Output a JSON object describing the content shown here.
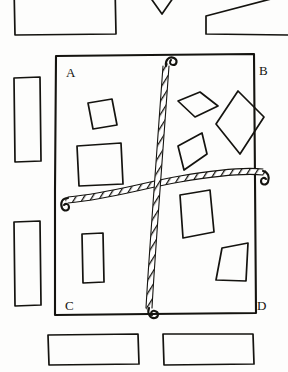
{
  "figure": {
    "kind": "hand-drawn-line-diagram",
    "medium": "ink-pen-sketch",
    "background_color": "#fdfdfc",
    "ink_color": "#14130f",
    "width": 288,
    "height": 372
  },
  "frame": {
    "name": "main-rectangle-frame",
    "note": "large hand-drawn rectangle occupying the center of the sheet",
    "corner_labels": [
      {
        "id": "A",
        "text": "A",
        "corner": "top-left",
        "x": 66,
        "y": 72
      },
      {
        "id": "B",
        "text": "B",
        "corner": "top-right",
        "x": 260,
        "y": 70
      },
      {
        "id": "C",
        "text": "C",
        "corner": "bottom-left",
        "x": 65,
        "y": 309
      },
      {
        "id": "D",
        "text": "D",
        "corner": "bottom-right",
        "x": 258,
        "y": 309
      }
    ],
    "outline_points": "56,56 254,54 256,313 55,315"
  },
  "ropes": [
    {
      "name": "vertical-rope",
      "orientation": "vertical",
      "texture": "twisted-braided-cord",
      "ends": [
        {
          "name": "top-hook",
          "x": 166,
          "y": 60,
          "shape": "hook-loop"
        },
        {
          "name": "bottom-hook",
          "x": 150,
          "y": 318,
          "shape": "hook-loop"
        }
      ],
      "path": "166,64 163,110 161,150 159,178 156,210 152,250 150,285 149,310"
    },
    {
      "name": "horizontal-rope",
      "orientation": "horizontal",
      "texture": "twisted-braided-cord",
      "ends": [
        {
          "name": "left-hook",
          "x": 62,
          "y": 200,
          "shape": "hook-loop"
        },
        {
          "name": "right-hook",
          "x": 266,
          "y": 185,
          "shape": "hook-loop"
        }
      ],
      "path": "66,202 100,196 130,190 160,184 190,178 220,174 250,172 264,173"
    }
  ],
  "shapes_inside": [
    {
      "name": "small-tilted-square",
      "quadrant": "upper-left",
      "points": "88,103 112,99 117,125 93,129"
    },
    {
      "name": "large-square",
      "quadrant": "upper-left",
      "points": "77,146 121,143 123,184 79,186"
    },
    {
      "name": "wide-diamond",
      "quadrant": "upper-right",
      "points": "178,101 200,92 218,106 195,117"
    },
    {
      "name": "tall-diamond",
      "quadrant": "upper-right",
      "points": "238,91 264,117 240,154 216,124"
    },
    {
      "name": "slanted-rhombus",
      "quadrant": "upper-right",
      "points": "178,146 202,133 207,154 184,170"
    },
    {
      "name": "tall-rectangle-inner",
      "quadrant": "lower-left",
      "points": "82,234 103,233 104,282 83,283"
    },
    {
      "name": "irregular-quad-upper",
      "quadrant": "lower-right",
      "points": "180,195 210,190 214,232 183,238"
    },
    {
      "name": "irregular-quad-lower",
      "quadrant": "lower-right",
      "points": "222,248 248,243 246,281 216,280"
    }
  ],
  "shapes_outside": [
    {
      "name": "left-tall-rectangle-upper",
      "side": "left",
      "points": "14,78 40,77 41,161 15,162"
    },
    {
      "name": "left-tall-rectangle-lower",
      "side": "left",
      "points": "14,222 40,221 41,305 15,306"
    },
    {
      "name": "top-large-rectangle",
      "side": "top",
      "points": "14,-14 115,-14 116,34 15,35"
    },
    {
      "name": "top-chevron",
      "side": "top",
      "points": "145,-10 162,14 180,-12"
    },
    {
      "name": "top-right-trapezoid",
      "side": "top",
      "points": "206,16 288,-6 288,35 206,34"
    },
    {
      "name": "bottom-rectangle-left",
      "side": "bottom",
      "points": "48,335 138,334 139,364 49,365"
    },
    {
      "name": "bottom-rectangle-right",
      "side": "bottom",
      "points": "163,334 253,334 254,364 164,365"
    }
  ]
}
